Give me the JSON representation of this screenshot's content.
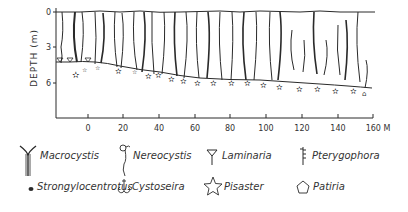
{
  "figure": {
    "title": "",
    "y_axis": {
      "label": "DEPTH (m)",
      "ticks": [
        "0",
        "3",
        "6"
      ]
    },
    "x_axis": {
      "ticks": [
        "0",
        "20",
        "40",
        "60",
        "80",
        "100",
        "120",
        "140",
        "160 M"
      ],
      "unit": "M"
    }
  },
  "legend": {
    "items": [
      {
        "name": "Macrocystis",
        "icon": "macrocystis-icon"
      },
      {
        "name": "Nereocystis",
        "icon": "nereocystis-icon"
      },
      {
        "name": "Laminaria",
        "icon": "laminaria-icon"
      },
      {
        "name": "Pterygophora",
        "icon": "pterygophora-icon"
      },
      {
        "name": "Strongylocentrotus",
        "icon": "strongylocentrotus-dot-icon"
      },
      {
        "name": "Cystoseira",
        "icon": "cystoseira-icon"
      },
      {
        "name": "Pisaster",
        "icon": "pisaster-star-icon"
      },
      {
        "name": "Patiria",
        "icon": "patiria-pentagon-icon"
      }
    ]
  },
  "colors": {
    "ink": "#2a2a2a",
    "background": "#ffffff"
  }
}
